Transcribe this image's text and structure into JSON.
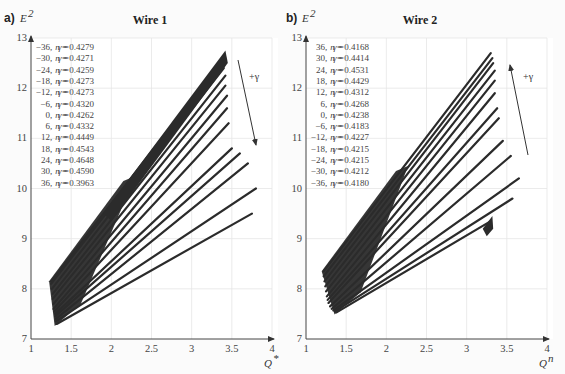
{
  "chart_data": [
    {
      "type": "line",
      "panel_label": "a)",
      "title": "Wire 1",
      "xlabel": "Q*",
      "ylabel": "E²",
      "xlim": [
        1,
        4
      ],
      "ylim": [
        7,
        13
      ],
      "x_ticks": [
        "1",
        "1.5",
        "2",
        "2.5",
        "3",
        "3.5",
        "4"
      ],
      "y_ticks": [
        "7",
        "8",
        "9",
        "10",
        "11",
        "12",
        "13"
      ],
      "grid": true,
      "annotation": "+γ",
      "arrow_direction": "down",
      "legend": [
        "γ = −36, n = 0.4279",
        "γ = −30, n = 0.4271",
        "γ = −24, n = 0.4259",
        "γ = −18, n = 0.4273",
        "γ = −12, n = 0.4273",
        "γ =   −6, n = 0.4320",
        "γ =    0, n = 0.4262",
        "γ =    6, n = 0.4332",
        "γ =   12, n = 0.4449",
        "γ =   18, n = 0.4543",
        "γ =   24, n = 0.4648",
        "γ =   30, n = 0.4590",
        "γ =   36, n = 0.3963"
      ],
      "series": [
        {
          "name": "γ = −36",
          "gamma": -36,
          "n": 0.4279,
          "x": [
            1.25,
            3.4
          ],
          "y": [
            8.15,
            12.6
          ]
        },
        {
          "name": "γ = −30",
          "gamma": -30,
          "n": 0.4271,
          "x": [
            1.25,
            3.4
          ],
          "y": [
            8.1,
            12.5
          ]
        },
        {
          "name": "γ = −24",
          "gamma": -24,
          "n": 0.4259,
          "x": [
            1.26,
            3.4
          ],
          "y": [
            8.0,
            12.4
          ]
        },
        {
          "name": "γ = −18",
          "gamma": -18,
          "n": 0.4273,
          "x": [
            1.27,
            3.42
          ],
          "y": [
            7.9,
            12.25
          ]
        },
        {
          "name": "γ = −12",
          "gamma": -12,
          "n": 0.4273,
          "x": [
            1.27,
            3.42
          ],
          "y": [
            7.8,
            12.05
          ]
        },
        {
          "name": "γ = −6",
          "gamma": -6,
          "n": 0.432,
          "x": [
            1.28,
            3.44
          ],
          "y": [
            7.7,
            11.85
          ]
        },
        {
          "name": "γ = 0",
          "gamma": 0,
          "n": 0.4262,
          "x": [
            1.28,
            3.44
          ],
          "y": [
            7.6,
            11.6
          ]
        },
        {
          "name": "γ = 6",
          "gamma": 6,
          "n": 0.4332,
          "x": [
            1.29,
            3.46
          ],
          "y": [
            7.55,
            11.3
          ]
        },
        {
          "name": "γ = 12",
          "gamma": 12,
          "n": 0.4449,
          "x": [
            1.3,
            3.5
          ],
          "y": [
            7.5,
            10.8
          ]
        },
        {
          "name": "γ = 18",
          "gamma": 18,
          "n": 0.4543,
          "x": [
            1.3,
            3.6
          ],
          "y": [
            7.45,
            10.7
          ]
        },
        {
          "name": "γ = 24",
          "gamma": 24,
          "n": 0.4648,
          "x": [
            1.31,
            3.7
          ],
          "y": [
            7.4,
            10.5
          ]
        },
        {
          "name": "γ = 30",
          "gamma": 30,
          "n": 0.459,
          "x": [
            1.31,
            3.8
          ],
          "y": [
            7.35,
            10.0
          ]
        },
        {
          "name": "γ = 36",
          "gamma": 36,
          "n": 0.3963,
          "x": [
            1.32,
            3.75
          ],
          "y": [
            7.3,
            9.5
          ]
        }
      ]
    },
    {
      "type": "line",
      "panel_label": "b)",
      "title": "Wire 2",
      "xlabel": "Q*",
      "ylabel": "E²",
      "xlim": [
        1,
        4
      ],
      "ylim": [
        7,
        13
      ],
      "x_ticks": [
        "1",
        "1.5",
        "2",
        "2.5",
        "3",
        "3.5",
        "4"
      ],
      "y_ticks": [
        "7",
        "8",
        "9",
        "10",
        "11",
        "12",
        "13"
      ],
      "grid": true,
      "annotation": "+γ",
      "arrow_direction": "up",
      "legend": [
        "γ =   36, n = 0.4168",
        "γ =   30, n = 0.4414",
        "γ =   24, n = 0.4531",
        "γ =   18, n = 0.4429",
        "γ =   12, n = 0.4312",
        "γ =    6, n = 0.4268",
        "γ =    0, n = 0.4238",
        "γ =   −6, n = 0.4183",
        "γ = −12, n = 0.4227",
        "γ = −18, n = 0.4215",
        "γ = −24, n = 0.4215",
        "γ = −30, n = 0.4212",
        "γ = −36, n = 0.4180"
      ],
      "series": [
        {
          "name": "γ = 36",
          "gamma": 36,
          "n": 0.4168,
          "x": [
            1.22,
            3.3
          ],
          "y": [
            8.35,
            12.7
          ]
        },
        {
          "name": "γ = 30",
          "gamma": 30,
          "n": 0.4414,
          "x": [
            1.22,
            3.32
          ],
          "y": [
            8.25,
            12.6
          ]
        },
        {
          "name": "γ = 24",
          "gamma": 24,
          "n": 0.4531,
          "x": [
            1.23,
            3.33
          ],
          "y": [
            8.15,
            12.5
          ]
        },
        {
          "name": "γ = 18",
          "gamma": 18,
          "n": 0.4429,
          "x": [
            1.24,
            3.35
          ],
          "y": [
            8.05,
            12.35
          ]
        },
        {
          "name": "γ = 12",
          "gamma": 12,
          "n": 0.4312,
          "x": [
            1.25,
            3.35
          ],
          "y": [
            7.95,
            12.15
          ]
        },
        {
          "name": "γ = 6",
          "gamma": 6,
          "n": 0.4268,
          "x": [
            1.26,
            3.35
          ],
          "y": [
            7.85,
            11.9
          ]
        },
        {
          "name": "γ = 0",
          "gamma": 0,
          "n": 0.4238,
          "x": [
            1.27,
            3.38
          ],
          "y": [
            7.78,
            11.6
          ]
        },
        {
          "name": "γ = −6",
          "gamma": -6,
          "n": 0.4183,
          "x": [
            1.28,
            3.4
          ],
          "y": [
            7.72,
            11.4
          ]
        },
        {
          "name": "γ = −12",
          "gamma": -12,
          "n": 0.4227,
          "x": [
            1.3,
            3.45
          ],
          "y": [
            7.65,
            10.95
          ]
        },
        {
          "name": "γ = −18",
          "gamma": -18,
          "n": 0.4215,
          "x": [
            1.32,
            3.55
          ],
          "y": [
            7.6,
            10.65
          ]
        },
        {
          "name": "γ = −24",
          "gamma": -24,
          "n": 0.4215,
          "x": [
            1.34,
            3.65
          ],
          "y": [
            7.57,
            10.2
          ]
        },
        {
          "name": "γ = −30",
          "gamma": -30,
          "n": 0.4212,
          "x": [
            1.36,
            3.57
          ],
          "y": [
            7.55,
            9.8
          ]
        },
        {
          "name": "γ = −36",
          "gamma": -36,
          "n": 0.418,
          "x": [
            1.38,
            3.3
          ],
          "y": [
            7.53,
            9.35
          ]
        }
      ]
    }
  ]
}
